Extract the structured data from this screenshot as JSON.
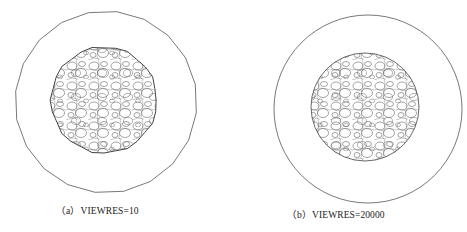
{
  "figure": {
    "panels": [
      {
        "id": "a",
        "label": "(a)",
        "caption_text": "VIEWRES=10",
        "caption": "（a）VIEWRES=10",
        "outer_shape": "polygon",
        "outer_sides": 20,
        "center": [
          106,
          102
        ],
        "outer_radius": 91,
        "inner_center": [
          104,
          100
        ],
        "inner_radius": 53
      },
      {
        "id": "b",
        "label": "(b)",
        "caption_text": "VIEWRES=20000",
        "caption": "（b）VIEWRES=20000",
        "outer_shape": "circle",
        "center": [
          368,
          109
        ],
        "outer_radius": 94,
        "inner_center": [
          365,
          107
        ],
        "inner_radius": 54
      }
    ],
    "colors": {
      "line": "#555555",
      "background": "#ffffff",
      "text": "#222222"
    }
  }
}
